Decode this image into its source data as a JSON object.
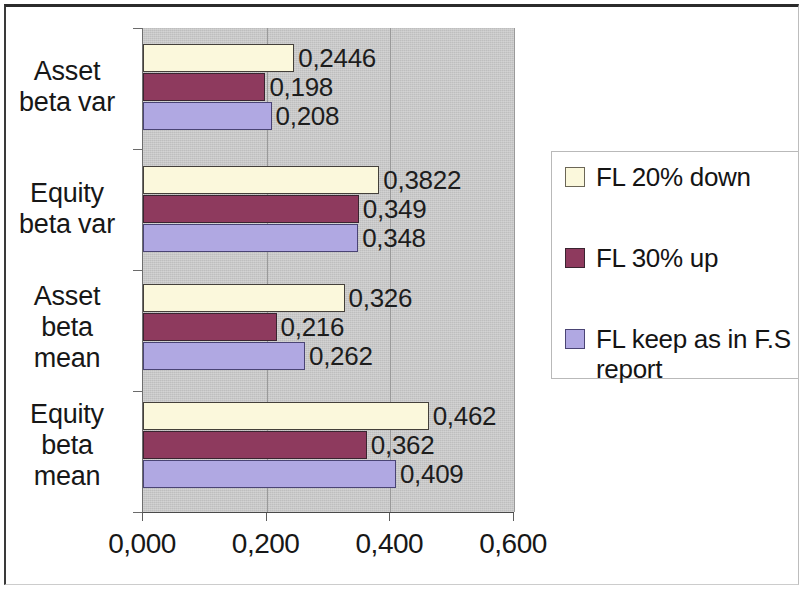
{
  "chart_data": {
    "type": "bar",
    "orientation": "horizontal",
    "title": "",
    "xlabel": "",
    "ylabel": "",
    "xlim": [
      0,
      0.6
    ],
    "xticks": [
      "0,000",
      "0,200",
      "0,400",
      "0,600"
    ],
    "xtick_values": [
      0,
      0.2,
      0.4,
      0.6
    ],
    "grid": true,
    "legend_position": "right",
    "categories": [
      "Asset beta var",
      "Equity beta var",
      "Asset beta mean",
      "Equity beta mean"
    ],
    "category_lines": [
      [
        "Asset",
        "beta var"
      ],
      [
        "Equity",
        "beta var"
      ],
      [
        "Asset",
        "beta",
        "mean"
      ],
      [
        "Equity",
        "beta",
        "mean"
      ]
    ],
    "series": [
      {
        "name": "FL 20% down",
        "color": "#fbf8dc",
        "values": [
          0.2446,
          0.3822,
          0.326,
          0.462
        ],
        "labels": [
          "0,2446",
          "0,3822",
          "0,326",
          "0,462"
        ]
      },
      {
        "name": "FL 30% up",
        "color": "#8e3a5e",
        "values": [
          0.198,
          0.349,
          0.216,
          0.362
        ],
        "labels": [
          "0,198",
          "0,349",
          "0,216",
          "0,362"
        ]
      },
      {
        "name": "FL keep as in F.S report",
        "color": "#b0a8e2",
        "values": [
          0.208,
          0.348,
          0.262,
          0.409
        ],
        "labels": [
          "0,208",
          "0,348",
          "0,262",
          "0,409"
        ]
      }
    ]
  },
  "legend": {
    "entries": [
      {
        "label": "FL 20% down",
        "swatch": "s0"
      },
      {
        "label": "FL 30% up",
        "swatch": "s1"
      },
      {
        "label": "FL keep as in F.S report",
        "swatch": "s2"
      }
    ]
  },
  "colors": {
    "plot_background": "#c6c6c6",
    "frame": "#2b2b2b",
    "series_1": "#fbf8dc",
    "series_2": "#8e3a5e",
    "series_3": "#b0a8e2"
  }
}
